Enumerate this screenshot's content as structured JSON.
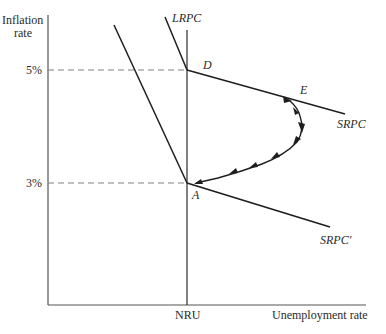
{
  "axes": {
    "y_label_line1": "Inflation",
    "y_label_line2": "rate",
    "x_label": "Unemployment rate",
    "x_tick": "NRU",
    "y_ticks": [
      "5%",
      "3%"
    ]
  },
  "curves": {
    "lrpc": "LRPC",
    "srpc": "SRPC",
    "srpc_prime": "SRPC′"
  },
  "points": {
    "d": "D",
    "e": "E",
    "a": "A"
  },
  "colors": {
    "line": "#1e1e1e",
    "axis": "#555555",
    "dash": "#808080"
  }
}
